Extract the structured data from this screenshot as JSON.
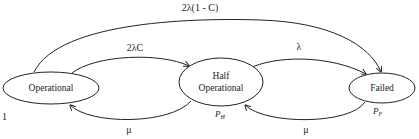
{
  "diagram": {
    "type": "state-transition",
    "nodes": [
      {
        "id": "operational",
        "label": "Operational",
        "cx": 51,
        "cy": 88,
        "rx": 48,
        "ry": 16
      },
      {
        "id": "half",
        "label_line1": "Half",
        "label_line2": "Operational",
        "cx": 221,
        "cy": 82,
        "rx": 42,
        "ry": 24,
        "prob_label": "P",
        "prob_sub": "H"
      },
      {
        "id": "failed",
        "label": "Failed",
        "cx": 382,
        "cy": 88,
        "rx": 33,
        "ry": 15,
        "prob_label": "P",
        "prob_sub": "F"
      }
    ],
    "edges": [
      {
        "from": "operational",
        "to": "failed",
        "label": "2λ(1 - C)"
      },
      {
        "from": "operational",
        "to": "half",
        "label": "2λC"
      },
      {
        "from": "half",
        "to": "failed",
        "label": "λ"
      },
      {
        "from": "half",
        "to": "operational",
        "label": "μ"
      },
      {
        "from": "failed",
        "to": "half",
        "label": "μ"
      }
    ],
    "stray_mark": "1",
    "colors": {
      "line": "#222222",
      "background": "#ffffff"
    }
  }
}
